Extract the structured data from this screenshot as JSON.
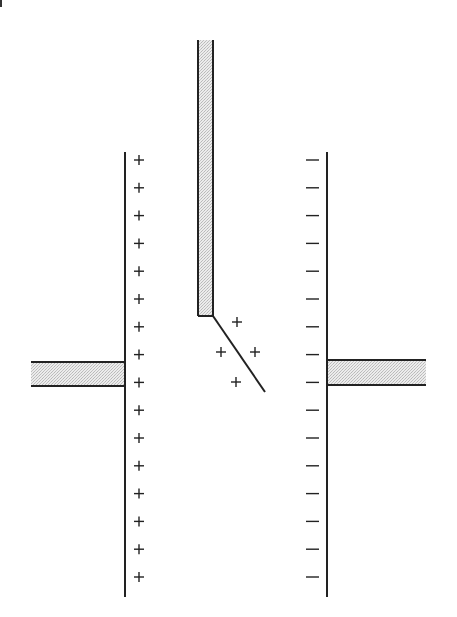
{
  "diagram": {
    "type": "electrostatics",
    "colors": {
      "line": "#222222",
      "fill_stipple": "#d9d9d9",
      "background": "#ffffff"
    },
    "left_plate": {
      "charge_sign": "+",
      "charge_count": 16,
      "x": 125,
      "y_top": 152,
      "y_bottom": 597
    },
    "right_plate": {
      "charge_sign": "—",
      "charge_count": 16,
      "x": 327,
      "y_top": 152,
      "y_bottom": 597
    },
    "left_lead": {
      "x1": 31,
      "x2": 125,
      "y_top": 362,
      "y_bottom": 386
    },
    "right_lead": {
      "x1": 327,
      "x2": 426,
      "y_top": 360,
      "y_bottom": 385
    },
    "top_rod": {
      "x_left": 198,
      "x_right": 213,
      "y_top": 40,
      "y_bottom": 316
    },
    "rod_tip_line": {
      "x1": 213,
      "y1": 316,
      "x2": 265,
      "y2": 392
    },
    "tip_charges": {
      "sign": "+",
      "positions": [
        [
          237,
          322
        ],
        [
          221,
          352
        ],
        [
          255,
          352
        ],
        [
          236,
          382
        ]
      ]
    }
  }
}
